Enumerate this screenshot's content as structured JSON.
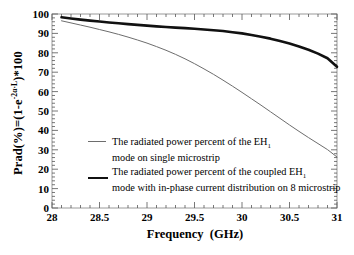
{
  "chart_data": {
    "type": "line",
    "title": "",
    "xlabel": "Frequency  (GHz)",
    "ylabel_text": "Prad(%)=(1-e",
    "ylabel_exp": "-2α·L",
    "ylabel_tail": ")*100",
    "xlim": [
      28,
      31
    ],
    "ylim": [
      0,
      100
    ],
    "grid": false,
    "legend_position": "center-left",
    "xticks": [
      "28",
      "28.5",
      "29",
      "29.5",
      "30",
      "30.5",
      "31"
    ],
    "xtick_values": [
      28,
      28.5,
      29,
      29.5,
      30,
      30.5,
      31
    ],
    "yticks": [
      "0",
      "10",
      "20",
      "30",
      "40",
      "50",
      "60",
      "70",
      "80",
      "90",
      "100"
    ],
    "ytick_values": [
      0,
      10,
      20,
      30,
      40,
      50,
      60,
      70,
      80,
      90,
      100
    ],
    "series": [
      {
        "name": "single-microstrip-EH1",
        "legend_line1": "The radiated power percent of the EH",
        "legend_sub1": "1",
        "legend_line2": "mode on single microstrip",
        "color": "#6d6d6d",
        "width": 1,
        "x": [
          28.1,
          28.2,
          28.3,
          28.4,
          28.5,
          28.6,
          28.7,
          28.8,
          28.9,
          29.0,
          29.1,
          29.2,
          29.3,
          29.4,
          29.5,
          29.6,
          29.7,
          29.8,
          29.9,
          30.0,
          30.1,
          30.2,
          30.3,
          30.4,
          30.5,
          30.6,
          30.7,
          30.8,
          30.9,
          31.0
        ],
        "y": [
          96.5,
          95.4,
          94.3,
          93.2,
          92.0,
          90.8,
          89.5,
          88.1,
          86.6,
          85.0,
          83.2,
          81.3,
          79.2,
          76.9,
          74.4,
          71.7,
          68.9,
          65.9,
          62.8,
          59.6,
          56.3,
          53.0,
          49.6,
          46.2,
          42.8,
          39.5,
          36.3,
          33.2,
          30.1,
          26.3
        ]
      },
      {
        "name": "coupled-8-microstrip-EH1-in-phase",
        "legend_line1": "The radiated power percent of the coupled EH",
        "legend_sub1": "1",
        "legend_line2": "mode with in-phase current distribution on 8 microstrip",
        "color": "#111111",
        "width": 2.6,
        "x": [
          28.1,
          28.2,
          28.3,
          28.4,
          28.5,
          28.6,
          28.7,
          28.8,
          28.9,
          29.0,
          29.1,
          29.2,
          29.3,
          29.4,
          29.5,
          29.6,
          29.7,
          29.8,
          29.9,
          30.0,
          30.1,
          30.2,
          30.3,
          30.4,
          30.5,
          30.6,
          30.7,
          30.8,
          30.9,
          31.0
        ],
        "y": [
          98.3,
          97.7,
          97.1,
          96.6,
          96.1,
          95.6,
          95.2,
          94.8,
          94.4,
          94.0,
          93.6,
          93.3,
          93.0,
          92.7,
          92.4,
          92.0,
          91.6,
          91.2,
          90.6,
          90.0,
          89.2,
          88.3,
          87.3,
          86.1,
          84.8,
          83.3,
          81.6,
          79.6,
          77.2,
          72.8
        ]
      }
    ]
  },
  "axes": {
    "x_title": "Frequency  (GHz)",
    "y_title_main": "Prad(%)=(1-e",
    "y_title_exp": "-2α·L",
    "y_title_end": ")*100"
  }
}
